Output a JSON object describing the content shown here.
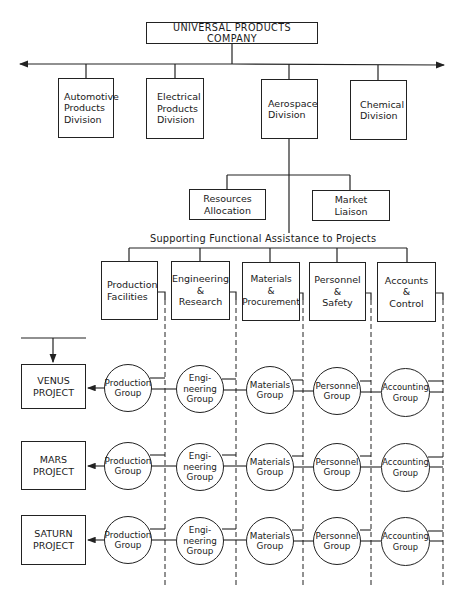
{
  "company": {
    "name": "UNIVERSAL PRODUCTS COMPANY"
  },
  "divisions": [
    {
      "label": "Automotive\nProducts\nDivision"
    },
    {
      "label": "Electrical\nProducts\nDivision"
    },
    {
      "label": "Aerospace\nDivision"
    },
    {
      "label": "Chemical\nDivision"
    }
  ],
  "staff_units": [
    {
      "label": "Resources\nAllocation"
    },
    {
      "label": "Market\nLiaison"
    }
  ],
  "functional_heading": "Supporting Functional Assistance to Projects",
  "functions": [
    {
      "label": "Production\nFacilities"
    },
    {
      "label": "Engineering\n&\nResearch"
    },
    {
      "label": "Materials\n&\nProcurement"
    },
    {
      "label": "Personnel\n&\nSafety"
    },
    {
      "label": "Accounts\n&\nControl"
    }
  ],
  "projects": [
    {
      "label": "VENUS\nPROJECT",
      "groups": [
        "Production\nGroup",
        "Engi-\nneering\nGroup",
        "Materials\nGroup",
        "Personnel\nGroup",
        "Accounting\nGroup"
      ]
    },
    {
      "label": "MARS\nPROJECT",
      "groups": [
        "Production\nGroup",
        "Engi-\nneering\nGroup",
        "Materials\nGroup",
        "Personnel\nGroup",
        "Accounting\nGroup"
      ]
    },
    {
      "label": "SATURN\nPROJECT",
      "groups": [
        "Production\nGroup",
        "Engi-\nneering\nGroup",
        "Materials\nGroup",
        "Personnel\nGroup",
        "Accounting\nGroup"
      ]
    }
  ],
  "colors": {
    "line": "#222222",
    "background": "#ffffff"
  }
}
